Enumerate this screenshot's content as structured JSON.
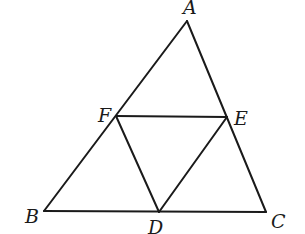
{
  "diagram": {
    "type": "geometry",
    "stroke_color": "#1a1a1a",
    "background_color": "#ffffff",
    "points": {
      "A": {
        "label": "A",
        "x": 187,
        "y": 21,
        "label_x": 183,
        "label_y": 14
      },
      "B": {
        "label": "B",
        "x": 44,
        "y": 211,
        "label_x": 25,
        "label_y": 223
      },
      "C": {
        "label": "C",
        "x": 266,
        "y": 212,
        "label_x": 271,
        "label_y": 228
      },
      "D": {
        "label": "D",
        "x": 159,
        "y": 212,
        "label_x": 148,
        "label_y": 234
      },
      "E": {
        "label": "E",
        "x": 227,
        "y": 117,
        "label_x": 234,
        "label_y": 125
      },
      "F": {
        "label": "F",
        "x": 116,
        "y": 116,
        "label_x": 98,
        "label_y": 122
      }
    },
    "segments": [
      {
        "from": "A",
        "to": "B"
      },
      {
        "from": "B",
        "to": "C"
      },
      {
        "from": "C",
        "to": "A"
      },
      {
        "from": "F",
        "to": "E"
      },
      {
        "from": "F",
        "to": "D"
      },
      {
        "from": "D",
        "to": "E"
      }
    ]
  }
}
